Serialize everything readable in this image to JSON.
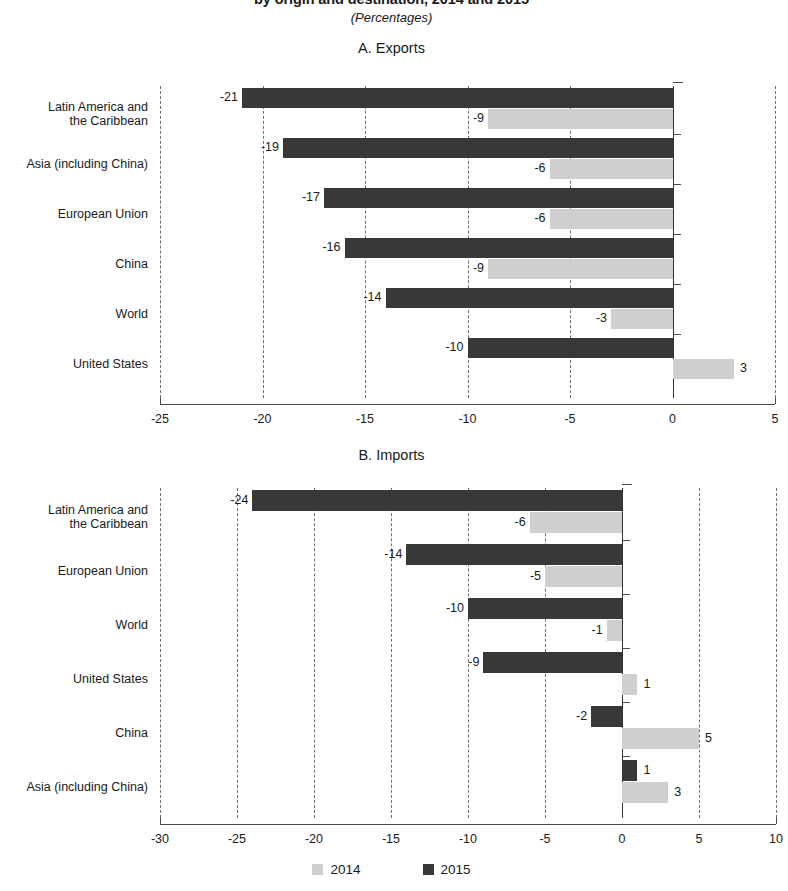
{
  "figure": {
    "title": "by origin and destination, 2014 and 2015",
    "subtitle": "(Percentages)"
  },
  "legend": {
    "items": [
      {
        "label": "2014",
        "color": "#cfcfcf"
      },
      {
        "label": "2015",
        "color": "#383838"
      }
    ]
  },
  "panels": [
    {
      "title": "A. Exports"
    },
    {
      "title": "B. Imports"
    }
  ],
  "chart_data": [
    {
      "type": "bar",
      "title": "A. Exports",
      "orientation": "horizontal",
      "xlabel": "",
      "ylabel": "",
      "xlim": [
        -25,
        5
      ],
      "xticks": [
        -25,
        -20,
        -15,
        -10,
        -5,
        0,
        5
      ],
      "xtick_labels": [
        "-25",
        "-20",
        "-15",
        "-10",
        "-5",
        "0",
        "5"
      ],
      "grid": "vertical-dashed",
      "legend_position": "bottom-outside",
      "categories": [
        "Latin America and the Caribbean",
        "Asia (including China)",
        "European Union",
        "China",
        "World",
        "United States"
      ],
      "category_label_lines": [
        [
          "Latin America and",
          "the Caribbean"
        ],
        [
          "Asia (including China)"
        ],
        [
          "European Union"
        ],
        [
          "China"
        ],
        [
          "World"
        ],
        [
          "United States"
        ]
      ],
      "series": [
        {
          "name": "2015",
          "color": "#383838",
          "values": [
            -21,
            -19,
            -17,
            -16,
            -14,
            -10
          ]
        },
        {
          "name": "2014",
          "color": "#cfcfcf",
          "values": [
            -9,
            -6,
            -6,
            -9,
            -3,
            3
          ]
        }
      ],
      "data_labels": {
        "2015": [
          "-21",
          "-19",
          "-17",
          "-16",
          "-14",
          "-10"
        ],
        "2014": [
          "-9",
          "-6",
          "-6",
          "-9",
          "-3",
          "3"
        ]
      }
    },
    {
      "type": "bar",
      "title": "B. Imports",
      "orientation": "horizontal",
      "xlabel": "",
      "ylabel": "",
      "xlim": [
        -30,
        10
      ],
      "xticks": [
        -30,
        -25,
        -20,
        -15,
        -10,
        -5,
        0,
        5,
        10
      ],
      "xtick_labels": [
        "-30",
        "-25",
        "-20",
        "-15",
        "-10",
        "-5",
        "0",
        "5",
        "10"
      ],
      "grid": "vertical-dashed",
      "legend_position": "bottom-outside",
      "categories": [
        "Latin America and the Caribbean",
        "European Union",
        "World",
        "United States",
        "China",
        "Asia (including China)"
      ],
      "category_label_lines": [
        [
          "Latin America and",
          "the Caribbean"
        ],
        [
          "European Union"
        ],
        [
          "World"
        ],
        [
          "United States"
        ],
        [
          "China"
        ],
        [
          "Asia (including China)"
        ]
      ],
      "series": [
        {
          "name": "2015",
          "color": "#383838",
          "values": [
            -24,
            -14,
            -10,
            -9,
            -2,
            1
          ]
        },
        {
          "name": "2014",
          "color": "#cfcfcf",
          "values": [
            -6,
            -5,
            -1,
            1,
            5,
            3
          ]
        }
      ],
      "data_labels": {
        "2015": [
          "-24",
          "-14",
          "-10",
          "-9",
          "-2",
          "1"
        ],
        "2014": [
          "-6",
          "-5",
          "-1",
          "1",
          "5",
          "3"
        ]
      }
    }
  ]
}
